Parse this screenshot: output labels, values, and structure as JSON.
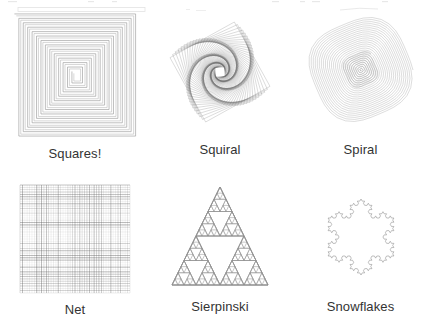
{
  "page": {
    "background": "#ffffff",
    "width": 431,
    "height": 321,
    "ink_color": "#808080",
    "caption_color": "#333333"
  },
  "figures": [
    {
      "id": "squares",
      "label": "Squares!",
      "icon_name": "square-spiral-figure",
      "type": "square_spiral",
      "box": {
        "x": 13,
        "y": 12,
        "width": 127,
        "height": 128
      },
      "params": {
        "turns": 13,
        "step_shrink": 4.6,
        "stroke": "#9a9a9a",
        "stroke_width": 0.7,
        "double_line": true
      }
    },
    {
      "id": "squiral",
      "label": "Squiral",
      "icon_name": "squiral-pinwheel-figure",
      "type": "rotating_square_spiral",
      "box": {
        "x": 176,
        "y": 16,
        "width": 100,
        "height": 114
      },
      "params": {
        "iterations": 72,
        "shrink": 0.972,
        "rotation_deg": 4.2,
        "start_rotation_deg": 16,
        "stroke": "#6e6e6e",
        "stroke_width": 0.45
      }
    },
    {
      "id": "spiral",
      "label": "Spiral",
      "icon_name": "polygon-spiral-figure",
      "type": "polygon_spiral",
      "box": {
        "x": 303,
        "y": 20,
        "width": 110,
        "height": 110
      },
      "params": {
        "center_x": 358,
        "center_y": 75,
        "max_radius": 54,
        "revolutions": 26,
        "points_per_rev": 37,
        "lobes": 4,
        "lobe_amount": 0.055,
        "stroke": "#a0a0a0",
        "stroke_width": 0.4
      }
    },
    {
      "id": "net",
      "label": "Net",
      "icon_name": "net-grid-figure",
      "type": "random_grid",
      "box": {
        "x": 16,
        "y": 184,
        "width": 110,
        "height": 108
      },
      "params": {
        "columns": 46,
        "rows": 46,
        "min_opacity": 0.06,
        "max_opacity": 0.85,
        "stroke": "#5e5e5e",
        "stroke_width": 0.55
      }
    },
    {
      "id": "sierpinski",
      "label": "Sierpinski",
      "icon_name": "sierpinski-triangle-figure",
      "type": "sierpinski",
      "box": {
        "x": 184,
        "y": 186,
        "width": 96,
        "height": 104
      },
      "params": {
        "depth": 4,
        "draw_subdivisions": true,
        "stroke": "#8f8f8f",
        "stroke_width": 0.5
      }
    },
    {
      "id": "snowflakes",
      "label": "Snowflakes",
      "icon_name": "koch-snowflake-figure",
      "type": "koch_snowflake",
      "box": {
        "x": 311,
        "y": 186,
        "width": 103,
        "height": 104
      },
      "params": {
        "depth": 3,
        "stroke": "#8a8a8a",
        "stroke_width": 0.55
      }
    }
  ]
}
